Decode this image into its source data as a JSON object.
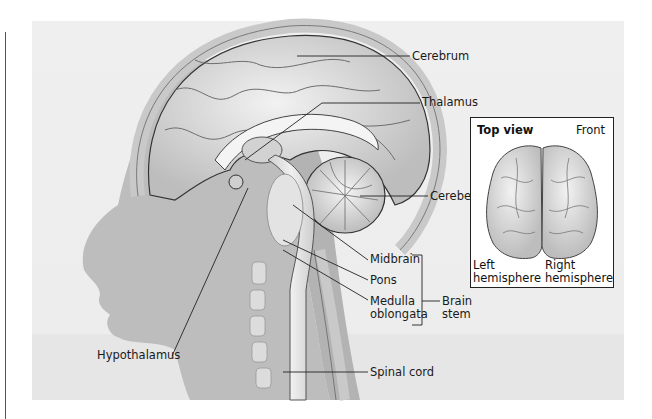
{
  "figure": {
    "type": "anatomical-illustration"
  },
  "labels": {
    "cerebrum": "Cerebrum",
    "thalamus": "Thalamus",
    "cerebellum": "Cerebellum",
    "midbrain": "Midbrain",
    "pons": "Pons",
    "medulla_line1": "Medulla",
    "medulla_line2": "oblongata",
    "brain_stem_line1": "Brain",
    "brain_stem_line2": "stem",
    "spinal_cord": "Spinal cord",
    "hypothalamus": "Hypothalamus"
  },
  "inset": {
    "title": "Top view",
    "orientation": "Front",
    "left_line1": "Left",
    "left_line2": "hemisphere",
    "right_line1": "Right",
    "right_line2": "hemisphere"
  },
  "colors": {
    "panel_bg": "#eeeeee",
    "silhouette": "#b9b9b9",
    "brain": "#d9d9d9",
    "line": "#222222"
  }
}
